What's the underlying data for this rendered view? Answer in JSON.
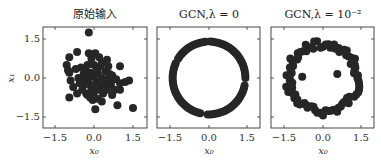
{
  "figure": {
    "panels": [
      {
        "title": "原始输入",
        "xlabel": "x₀",
        "ylabel": "x₁"
      },
      {
        "title": "GCN,λ = 0",
        "xlabel": "x₀",
        "ylabel": ""
      },
      {
        "title": "GCN,λ = 10⁻²",
        "xlabel": "x₀",
        "ylabel": ""
      }
    ],
    "xticks": [
      "−1.5",
      "0.0",
      "1.5"
    ],
    "yticks": [
      "1.5",
      "0.0",
      "−1.5"
    ]
  },
  "chart_data": [
    {
      "type": "scatter",
      "title": "原始输入",
      "xlabel": "x0",
      "ylabel": "x1",
      "xlim": [
        -1.96,
        2.04
      ],
      "ylim": [
        -1.92,
        1.96
      ],
      "xticks": [
        -1.5,
        0.0,
        1.5
      ],
      "yticks": [
        -1.5,
        0.0,
        1.5
      ],
      "grid": false,
      "marker_color": "#262626",
      "points": [
        [
          -0.2,
          1.75
        ],
        [
          -0.65,
          1.0
        ],
        [
          -0.95,
          0.8
        ],
        [
          -1.05,
          0.5
        ],
        [
          -1.0,
          0.3
        ],
        [
          -0.95,
          0.2
        ],
        [
          -0.2,
          0.95
        ],
        [
          0.05,
          0.95
        ],
        [
          -0.1,
          0.75
        ],
        [
          0.2,
          0.8
        ],
        [
          0.5,
          0.7
        ],
        [
          1.0,
          0.45
        ],
        [
          0.25,
          0.45
        ],
        [
          0.0,
          0.5
        ],
        [
          -0.25,
          0.5
        ],
        [
          -0.5,
          0.4
        ],
        [
          -0.4,
          0.15
        ],
        [
          -0.15,
          0.2
        ],
        [
          0.15,
          0.2
        ],
        [
          0.45,
          0.25
        ],
        [
          0.7,
          0.1
        ],
        [
          -0.6,
          0.0
        ],
        [
          -0.3,
          0.0
        ],
        [
          0.0,
          0.05
        ],
        [
          0.3,
          0.0
        ],
        [
          0.55,
          -0.05
        ],
        [
          0.85,
          -0.05
        ],
        [
          -0.9,
          -0.1
        ],
        [
          -0.55,
          -0.2
        ],
        [
          -0.2,
          -0.2
        ],
        [
          0.1,
          -0.15
        ],
        [
          0.4,
          -0.25
        ],
        [
          0.65,
          -0.25
        ],
        [
          1.0,
          -0.2
        ],
        [
          1.2,
          -0.15
        ],
        [
          1.35,
          -0.1
        ],
        [
          -0.8,
          -0.35
        ],
        [
          -0.45,
          -0.45
        ],
        [
          -0.1,
          -0.4
        ],
        [
          0.2,
          -0.45
        ],
        [
          0.5,
          -0.45
        ],
        [
          0.8,
          -0.45
        ],
        [
          1.0,
          -0.45
        ],
        [
          -0.65,
          -0.6
        ],
        [
          -0.3,
          -0.6
        ],
        [
          0.0,
          -0.55
        ],
        [
          0.35,
          -0.6
        ],
        [
          0.7,
          -0.65
        ],
        [
          -0.15,
          -0.75
        ],
        [
          -0.25,
          -0.65
        ],
        [
          0.15,
          -0.8
        ],
        [
          0.3,
          -0.9
        ],
        [
          -0.95,
          -0.75
        ],
        [
          -0.05,
          -0.85
        ],
        [
          0.9,
          -1.05
        ],
        [
          0.05,
          -1.2
        ],
        [
          1.5,
          -1.15
        ],
        [
          -0.35,
          0.35
        ],
        [
          0.3,
          0.6
        ],
        [
          -0.7,
          0.35
        ],
        [
          0.55,
          0.45
        ],
        [
          0.75,
          -0.05
        ],
        [
          -0.35,
          -0.25
        ],
        [
          0.1,
          0.3
        ],
        [
          -0.05,
          -0.3
        ],
        [
          0.25,
          -0.3
        ],
        [
          0.6,
          0.15
        ],
        [
          -0.5,
          -0.05
        ],
        [
          0.45,
          -0.1
        ],
        [
          -0.15,
          0.05
        ]
      ]
    },
    {
      "type": "scatter",
      "title": "GCN,λ = 0",
      "xlabel": "x0",
      "ylabel": "",
      "xlim": [
        -2.0,
        2.0
      ],
      "ylim": [
        -1.92,
        1.96
      ],
      "xticks": [
        -1.5,
        0.0,
        1.5
      ],
      "yticks": [
        -1.5,
        0.0,
        1.5
      ],
      "grid": false,
      "marker_color": "#262626",
      "shape": "points on a circle of radius ≈1.4 centered at (0,0), with small gaps",
      "radius": 1.4
    },
    {
      "type": "scatter",
      "title": "GCN,λ = 10⁻²",
      "xlabel": "x0",
      "ylabel": "",
      "xlim": [
        -2.0,
        2.0
      ],
      "ylim": [
        -1.92,
        1.96
      ],
      "xticks": [
        -1.5,
        0.0,
        1.5
      ],
      "yticks": [
        -1.5,
        0.0,
        1.5
      ],
      "grid": false,
      "marker_color": "#262626",
      "shape": "noisy ring of radius ≈1.3 centered at (0,0) plus two interior points",
      "radius": 1.3,
      "interior_points": [
        [
          -0.8,
          0.05
        ],
        [
          0.55,
          0.15
        ]
      ]
    }
  ]
}
